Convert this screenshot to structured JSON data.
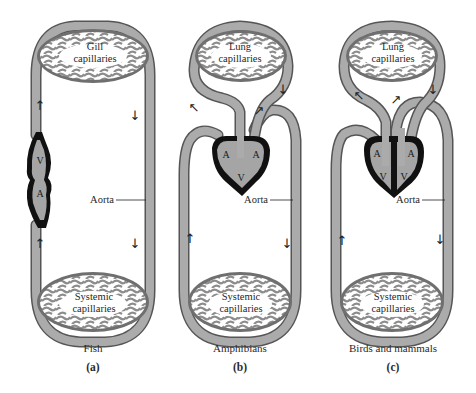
{
  "figure": {
    "colors": {
      "vessel_fill": "#a9a9a9",
      "vessel_edge": "#555555",
      "heart_outline": "#111111",
      "heart_fill": "#a0a0a0",
      "capillary_bg": "#ffffff",
      "text": "#222222"
    },
    "panels": [
      {
        "id": "a",
        "caption": "Fish",
        "letter": "(a)",
        "top_capillaries": {
          "line1": "Gill",
          "line2": "capillaries"
        },
        "bottom_capillaries": {
          "line1": "Systemic",
          "line2": "capillaries"
        },
        "aorta_label": "Aorta",
        "chambers": [
          "V",
          "A"
        ],
        "arrows": [
          "up",
          "down",
          "up",
          "down"
        ]
      },
      {
        "id": "b",
        "caption": "Amphibians",
        "letter": "(b)",
        "top_capillaries": {
          "line1": "Lung",
          "line2": "capillaries"
        },
        "bottom_capillaries": {
          "line1": "Systemic",
          "line2": "capillaries"
        },
        "aorta_label": "Aorta",
        "chambers": [
          "A",
          "A",
          "V"
        ],
        "arrows": [
          "down",
          "left-up",
          "right-up",
          "up",
          "down"
        ]
      },
      {
        "id": "c",
        "caption": "Birds and mammals",
        "letter": "(c)",
        "top_capillaries": {
          "line1": "Lung",
          "line2": "capillaries"
        },
        "bottom_capillaries": {
          "line1": "Systemic",
          "line2": "capillaries"
        },
        "aorta_label": "Aorta",
        "chambers": [
          "A",
          "A",
          "V",
          "V"
        ],
        "arrows": [
          "down",
          "left-up",
          "right-up",
          "up",
          "down"
        ]
      }
    ],
    "glyphs": {
      "up": "↑",
      "down": "↓",
      "left_up": "↖",
      "right_up": "↗"
    }
  }
}
